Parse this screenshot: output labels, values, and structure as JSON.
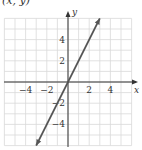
{
  "header": {
    "text": "(x, y)"
  },
  "chart_data": {
    "type": "line",
    "title": "",
    "xlabel": "x",
    "ylabel": "y",
    "xlim": [
      -6,
      6
    ],
    "ylim": [
      -6,
      6
    ],
    "grid": true,
    "x_ticks": [
      -4,
      -2,
      2,
      4
    ],
    "y_ticks": [
      4,
      2,
      -2,
      -4
    ],
    "x_tick_labels": [
      "−4",
      "−2",
      "2",
      "4"
    ],
    "y_tick_labels": [
      "4",
      "2",
      "−2",
      "−4"
    ],
    "series": [
      {
        "name": "y = 2x",
        "equation": "y = 2x",
        "slope": 2,
        "intercept": 0,
        "x": [
          -3,
          3
        ],
        "y": [
          -6,
          6
        ],
        "arrows": "both",
        "color": "#555555"
      }
    ]
  },
  "colors": {
    "grid": "#d9d9d9",
    "axis": "#333333",
    "line": "#555555"
  }
}
